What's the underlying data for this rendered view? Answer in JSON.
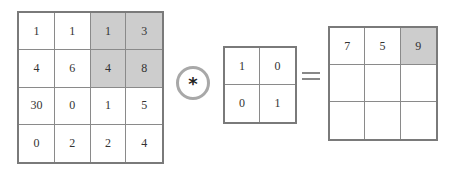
{
  "operator": {
    "symbol": "*",
    "name": "convolution"
  },
  "equals_symbol": "=",
  "colors": {
    "shaded": "#cdcdcd",
    "border": "#7a7a7a",
    "circle": "#a8a8a8"
  },
  "input_matrix": {
    "rows": [
      [
        "1",
        "1",
        "1",
        "3"
      ],
      [
        "4",
        "6",
        "4",
        "8"
      ],
      [
        "30",
        "0",
        "1",
        "5"
      ],
      [
        "0",
        "2",
        "2",
        "4"
      ]
    ],
    "shaded": [
      [
        0,
        2
      ],
      [
        0,
        3
      ],
      [
        1,
        2
      ],
      [
        1,
        3
      ]
    ]
  },
  "kernel_matrix": {
    "rows": [
      [
        "1",
        "0"
      ],
      [
        "0",
        "1"
      ]
    ]
  },
  "output_matrix": {
    "rows": [
      [
        "7",
        "5",
        "9"
      ],
      [
        "",
        "",
        ""
      ],
      [
        "",
        "",
        ""
      ]
    ],
    "shaded": [
      [
        0,
        2
      ]
    ]
  }
}
